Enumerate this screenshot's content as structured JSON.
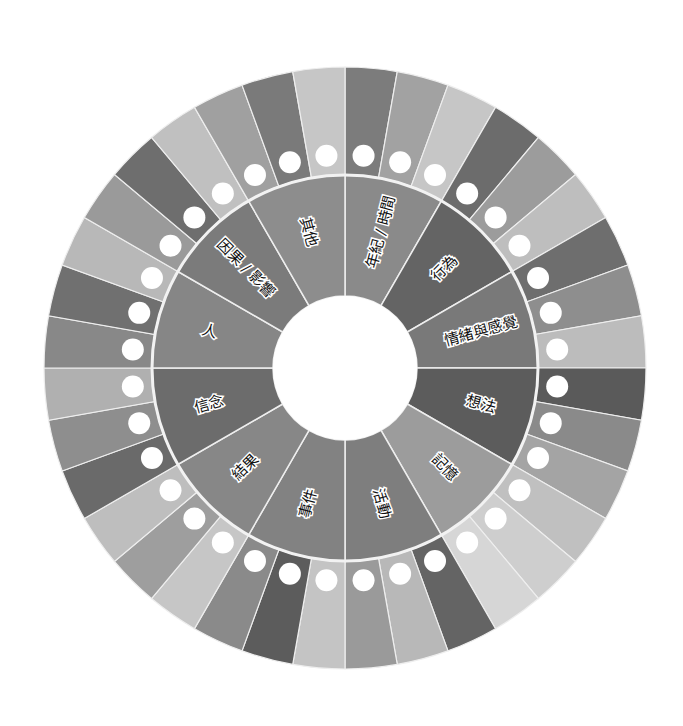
{
  "diagram": {
    "title": "",
    "center": {
      "x": 345,
      "y": 368
    },
    "radii": {
      "outer": 301,
      "ring_boundary": 193,
      "hole": 72,
      "dot_ring": 213,
      "dot": 11
    },
    "colors": {
      "background": "#ffffff",
      "divider": "#eeeeee",
      "dot": "#ffffff",
      "hole": "#ffffff"
    },
    "inner_segments": [
      {
        "label": "年紀 / 時間",
        "color": "#8a8a8a"
      },
      {
        "label": "行為",
        "color": "#646464"
      },
      {
        "label": "情緒與感覺",
        "color": "#797979"
      },
      {
        "label": "想法",
        "color": "#5c5c5c"
      },
      {
        "label": "記憶",
        "color": "#9c9c9c"
      },
      {
        "label": "活動",
        "color": "#7e7e7e"
      },
      {
        "label": "事件",
        "color": "#828282"
      },
      {
        "label": "結果",
        "color": "#878787"
      },
      {
        "label": "信念",
        "color": "#6c6c6c"
      },
      {
        "label": "人",
        "color": "#868686"
      },
      {
        "label": "因果 / 影響",
        "color": "#7b7b7b"
      },
      {
        "label": "其他",
        "color": "#8d8d8d"
      }
    ],
    "outer_segments": [
      "#7c7c7c",
      "#a2a2a2",
      "#c6c6c6",
      "#6c6c6c",
      "#9c9c9c",
      "#bebebe",
      "#6e6e6e",
      "#8e8e8e",
      "#bcbcbc",
      "#5a5a5a",
      "#8a8a8a",
      "#a4a4a4",
      "#c0c0c0",
      "#cecece",
      "#d6d6d6",
      "#646464",
      "#b8b8b8",
      "#9a9a9a",
      "#c4c4c4",
      "#5c5c5c",
      "#8a8a8a",
      "#c6c6c6",
      "#9e9e9e",
      "#bebebe",
      "#6a6a6a",
      "#8e8e8e",
      "#b0b0b0",
      "#888888",
      "#707070",
      "#b8b8b8",
      "#9a9a9a",
      "#6e6e6e",
      "#c0c0c0",
      "#a0a0a0",
      "#7a7a7a",
      "#c6c6c6"
    ]
  }
}
